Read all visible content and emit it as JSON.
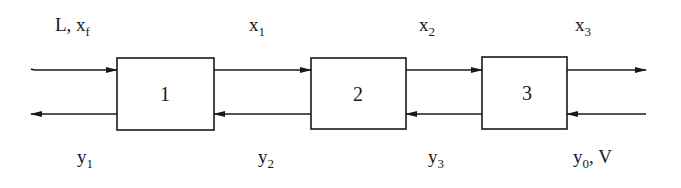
{
  "diagram": {
    "type": "countercurrent multistage cascade",
    "stages": [
      {
        "id": "1",
        "label": "1"
      },
      {
        "id": "2",
        "label": "2"
      },
      {
        "id": "3",
        "label": "3"
      }
    ],
    "top_stream_labels": [
      {
        "main": "L, x",
        "sub": "f"
      },
      {
        "main": "x",
        "sub": "1"
      },
      {
        "main": "x",
        "sub": "2"
      },
      {
        "main": "x",
        "sub": "3"
      }
    ],
    "bottom_stream_labels": [
      {
        "main": "y",
        "sub": "1",
        "tail": ""
      },
      {
        "main": "y",
        "sub": "2",
        "tail": ""
      },
      {
        "main": "y",
        "sub": "3",
        "tail": ""
      },
      {
        "main": "y",
        "sub": "0",
        "tail": ", V"
      }
    ],
    "top_flow_direction": "left-to-right",
    "bottom_flow_direction": "right-to-left",
    "line_color": "#1a1a1a",
    "background_color": "#ffffff"
  }
}
